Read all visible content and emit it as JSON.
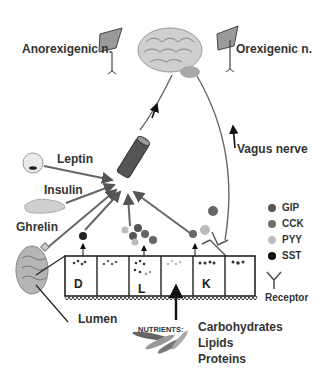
{
  "diagram": {
    "neurons": {
      "anorexigenic": "Anorexigenic n.",
      "orexigenic": "Orexigenic n."
    },
    "nerve": "Vagus nerve",
    "hormones": {
      "leptin": "Leptin",
      "insulin": "Insulin",
      "ghrelin": "Ghrelin"
    },
    "cells": [
      "D",
      "",
      "L",
      "",
      "K",
      ""
    ],
    "lumen": "Lumen",
    "nutrients": {
      "label": "NUTRIENTS:",
      "items": [
        "Carbohydrates",
        "Lipids",
        "Proteins"
      ]
    },
    "legend": [
      {
        "label": "GIP",
        "color": "#555555"
      },
      {
        "label": "CCK",
        "color": "#6e6e6e"
      },
      {
        "label": "PYY",
        "color": "#bdbdbd"
      },
      {
        "label": "SST",
        "color": "#111111"
      },
      {
        "label": "Receptor",
        "icon": "receptor-icon"
      }
    ]
  }
}
